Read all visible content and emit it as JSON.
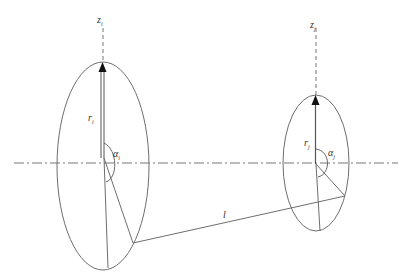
{
  "diagram": {
    "type": "geometric-schematic",
    "colors": {
      "stroke": "#6e6e6e",
      "axis": "#777777",
      "text": "#333333",
      "background": "#ffffff"
    },
    "loop_i": {
      "axis_label": {
        "base": "z",
        "sub": "i"
      },
      "radius_label": {
        "base": "r",
        "sub": "i"
      },
      "angle_label": {
        "base": "α",
        "sub": "i"
      }
    },
    "loop_j": {
      "axis_label": {
        "base": "z",
        "sub": "j"
      },
      "radius_label": {
        "base": "r",
        "sub": "j"
      },
      "angle_label": {
        "base": "α",
        "sub": "j"
      }
    },
    "distance_label": "l",
    "center_line": "dash-dot horizontal axis"
  }
}
